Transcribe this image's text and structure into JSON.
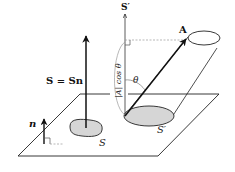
{
  "diagram": {
    "labels": {
      "s_vector": "S = Sn",
      "n_vector": "n",
      "area_s": "S",
      "area_s_prime": "S′",
      "axis_s_prime": "S′",
      "vector_a": "A",
      "angle": "θ",
      "projection": "|A| cos θ"
    },
    "colors": {
      "line": "#222222",
      "fill_area": "#d6d6d6",
      "dashed": "#999999"
    }
  }
}
